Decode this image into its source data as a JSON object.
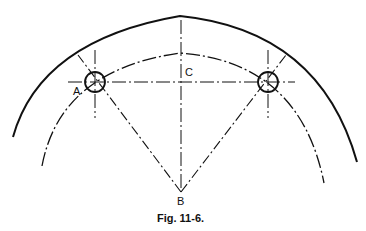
{
  "diagram": {
    "labels": {
      "a": "A",
      "b": "B",
      "c": "C"
    },
    "caption": "Fig. 11-6."
  }
}
